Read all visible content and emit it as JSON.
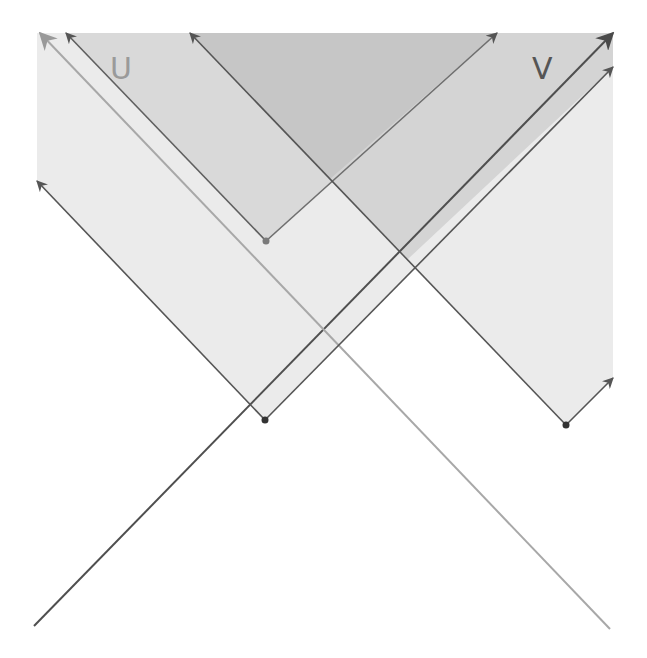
{
  "diagram": {
    "title": "",
    "labels": {
      "u": "U",
      "v": "V"
    },
    "colors": {
      "background": "#ffffff",
      "light_region": "#ebebeb",
      "mid_region": "#d9d9d9",
      "dark_region": "#c6c6c6",
      "dark_line": "#555555",
      "light_line": "#a8a8a8",
      "gray_point": "#7a7a7a",
      "dark_point": "#333333",
      "label_u": "#9a9a9a",
      "label_v": "#555555"
    },
    "points": [
      {
        "id": "p1",
        "x": 266,
        "y": 241,
        "style": "gray"
      },
      {
        "id": "p2",
        "x": 265,
        "y": 420,
        "style": "dark"
      },
      {
        "id": "p3",
        "x": 566,
        "y": 425,
        "style": "dark"
      }
    ],
    "lines": [
      {
        "id": "long-up-right",
        "from": [
          34,
          626
        ],
        "to": [
          613,
          33
        ],
        "arrow": true,
        "style": "dark"
      },
      {
        "id": "long-up-left",
        "from": [
          610,
          629
        ],
        "to": [
          40,
          33
        ],
        "arrow": true,
        "style": "light"
      },
      {
        "id": "p2-up-left",
        "from": [
          265,
          420
        ],
        "to": [
          37,
          181
        ],
        "arrow": true,
        "style": "dark"
      },
      {
        "id": "p2-up-right",
        "from": [
          265,
          420
        ],
        "to": [
          613,
          67
        ],
        "arrow": true,
        "style": "dark"
      },
      {
        "id": "p1-up-left",
        "from": [
          266,
          241
        ],
        "to": [
          66,
          33
        ],
        "arrow": true,
        "style": "dark"
      },
      {
        "id": "p1-up-right",
        "from": [
          266,
          241
        ],
        "to": [
          497,
          33
        ],
        "arrow": true,
        "style": "dark"
      },
      {
        "id": "p3-up-left",
        "from": [
          566,
          425
        ],
        "to": [
          190,
          33
        ],
        "arrow": true,
        "style": "dark"
      },
      {
        "id": "p3-up-right",
        "from": [
          566,
          425
        ],
        "to": [
          613,
          378
        ],
        "arrow": true,
        "style": "dark"
      }
    ]
  }
}
